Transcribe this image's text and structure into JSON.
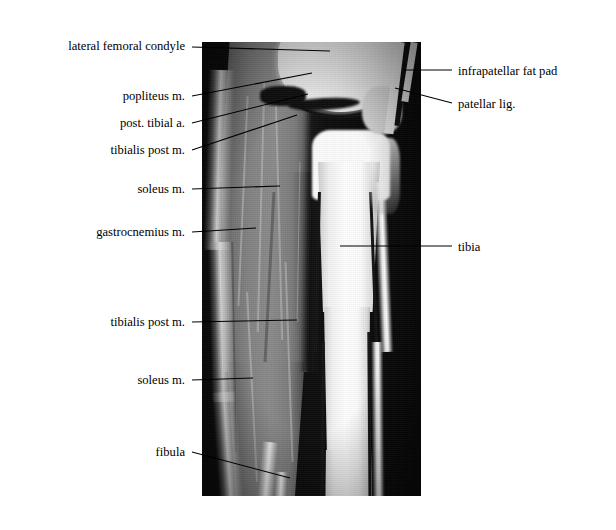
{
  "figure": {
    "type": "mri-anatomical-figure",
    "region": "knee and leg",
    "width": 616,
    "height": 530,
    "background_color": "#ffffff",
    "ink_color": "#000000"
  },
  "scan": {
    "left": 202,
    "top": 42,
    "width": 219,
    "height": 454,
    "background_color": "#0a0a0a",
    "bone_color": "#ffffff",
    "muscle_color": "#808080",
    "fat_color": "#eeeeee",
    "cortex_color": "#131313"
  },
  "labels_left": [
    {
      "text": "lateral femoral condyle",
      "text_x": 185,
      "text_y": 46,
      "leader": {
        "x1": 192,
        "y1": 47,
        "x2": 330,
        "y2": 51
      }
    },
    {
      "text": "popliteus m.",
      "text_x": 185,
      "text_y": 96,
      "leader": {
        "x1": 192,
        "y1": 96,
        "x2": 312,
        "y2": 73
      }
    },
    {
      "text": "post. tibial a.",
      "text_x": 185,
      "text_y": 123,
      "leader": {
        "x1": 192,
        "y1": 123,
        "x2": 308,
        "y2": 94
      }
    },
    {
      "text": "tibialis post m.",
      "text_x": 185,
      "text_y": 150,
      "leader": {
        "x1": 192,
        "y1": 150,
        "x2": 297,
        "y2": 115
      }
    },
    {
      "text": "soleus m.",
      "text_x": 185,
      "text_y": 189,
      "leader": {
        "x1": 192,
        "y1": 189,
        "x2": 280,
        "y2": 186
      }
    },
    {
      "text": "gastrocnemius m.",
      "text_x": 185,
      "text_y": 232,
      "leader": {
        "x1": 192,
        "y1": 232,
        "x2": 256,
        "y2": 228
      }
    },
    {
      "text": "tibialis post m.",
      "text_x": 185,
      "text_y": 322,
      "leader": {
        "x1": 192,
        "y1": 322,
        "x2": 297,
        "y2": 320
      }
    },
    {
      "text": "soleus m.",
      "text_x": 185,
      "text_y": 380,
      "leader": {
        "x1": 192,
        "y1": 380,
        "x2": 253,
        "y2": 378
      }
    },
    {
      "text": "fibula",
      "text_x": 185,
      "text_y": 452,
      "leader": {
        "x1": 192,
        "y1": 452,
        "x2": 290,
        "y2": 478
      }
    }
  ],
  "labels_right": [
    {
      "text": "infrapatellar  fat pad",
      "text_x": 458,
      "text_y": 71,
      "leader": {
        "x1": 404,
        "y1": 70,
        "x2": 452,
        "y2": 70
      }
    },
    {
      "text": "patellar  lig.",
      "text_x": 458,
      "text_y": 104,
      "leader": {
        "x1": 395,
        "y1": 88,
        "x2": 452,
        "y2": 103
      }
    },
    {
      "text": "tibia",
      "text_x": 458,
      "text_y": 247,
      "leader": {
        "x1": 340,
        "y1": 246,
        "x2": 452,
        "y2": 246
      }
    }
  ]
}
